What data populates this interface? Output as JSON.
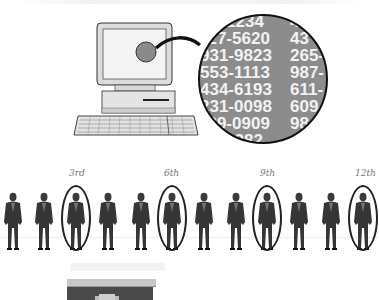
{
  "illustration": {
    "title": "Computer with magnified phone number list and systematic sampling of people",
    "magnifier": {
      "rows": [
        {
          "left": "5-1234",
          "right": "4"
        },
        {
          "left": "427-5620",
          "right": "43"
        },
        {
          "left": "931-9823",
          "right": "265-"
        },
        {
          "left": "553-1113",
          "right": "987-"
        },
        {
          "left": "434-6193",
          "right": "611-"
        },
        {
          "left": "231-0098",
          "right": "609-"
        },
        {
          "left": "329-0909",
          "right": "98"
        },
        {
          "left": "3-1282",
          "right": ""
        }
      ]
    },
    "sampling": {
      "labels": [
        "3rd",
        "6th",
        "9th",
        "12th"
      ],
      "people_count": 12,
      "selected_positions": [
        3,
        6,
        9,
        12
      ]
    }
  },
  "colors": {
    "magnifier_fill": "#8c8c8c",
    "outline": "#1a1a1a",
    "screen": "#f4f4f4",
    "monitor": "#e0e0e0",
    "suit": "#3a3a3a"
  }
}
